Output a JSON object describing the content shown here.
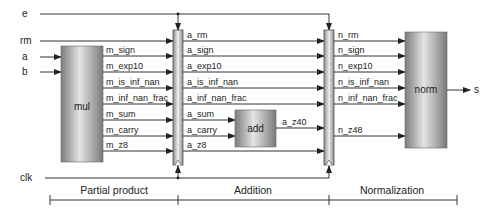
{
  "inputs": {
    "e": "e",
    "rm": "rm",
    "a": "a",
    "b": "b",
    "clk": "clk"
  },
  "blocks": {
    "mul": "mul",
    "add": "add",
    "norm": "norm"
  },
  "output": "s",
  "mul_signals": [
    "m_sign",
    "m_exp10",
    "m_is_inf_nan",
    "m_inf_nan_frac",
    "m_sum",
    "m_carry",
    "m_z8"
  ],
  "add_signals": [
    "a_rm",
    "a_sign",
    "a_exp10",
    "a_is_inf_nan",
    "a_inf_nan_frac",
    "a_sum",
    "a_carry",
    "a_z8"
  ],
  "add_output": "a_z40",
  "norm_signals": [
    "n_rm",
    "n_sign",
    "n_exp10",
    "n_is_inf_nan",
    "n_inf_nan_frac",
    "n_z48"
  ],
  "stages": [
    "Partial product",
    "Addition",
    "Normalization"
  ],
  "colors": {
    "block_dark": "#8a8a8a",
    "block_light": "#e6e6e6",
    "wire": "#333333"
  }
}
